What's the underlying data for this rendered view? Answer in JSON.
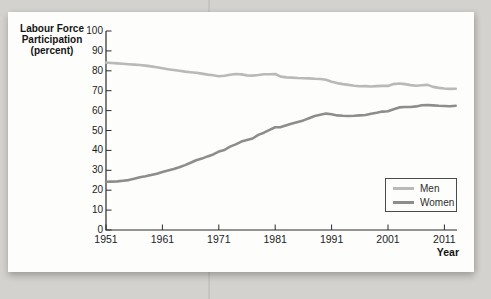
{
  "figure": {
    "y_axis_title_lines": [
      "Labour Force",
      "Participation",
      "(percent)"
    ],
    "x_axis_title": "Year"
  },
  "legend": {
    "items": [
      {
        "label": "Men",
        "color": "#b7bab5"
      },
      {
        "label": "Women",
        "color": "#8c8e8a"
      }
    ]
  },
  "colors": {
    "axis": "#2b2b2b",
    "men_line": "#b7bab5",
    "women_line": "#8c8e8a",
    "panel_bg": "#fdfdfc",
    "page_bg": "#d4d2cf"
  },
  "chart_data": {
    "type": "line",
    "title": "",
    "ylabel": "Labour Force Participation (percent)",
    "xlabel": "Year",
    "ylim": [
      0,
      100
    ],
    "xlim": [
      1951,
      2013
    ],
    "grid": false,
    "legend_position": "lower right",
    "y_ticks": [
      0,
      10,
      20,
      30,
      40,
      50,
      60,
      70,
      80,
      90,
      100
    ],
    "x_ticks": [
      1951,
      1961,
      1971,
      1981,
      1991,
      2001,
      2011
    ],
    "start_year": 1951,
    "series": [
      {
        "name": "Men",
        "color": "#b7bab5",
        "values": [
          84.1,
          83.9,
          83.7,
          83.5,
          83.3,
          83.1,
          82.9,
          82.6,
          82.2,
          81.8,
          81.3,
          80.8,
          80.4,
          80.0,
          79.6,
          79.3,
          79.0,
          78.6,
          78.1,
          77.8,
          77.3,
          77.5,
          78.0,
          78.4,
          78.2,
          77.7,
          77.6,
          77.9,
          78.3,
          78.3,
          78.4,
          77.1,
          76.7,
          76.6,
          76.4,
          76.3,
          76.2,
          76.0,
          75.9,
          75.5,
          74.5,
          73.8,
          73.3,
          72.9,
          72.5,
          72.2,
          72.3,
          72.1,
          72.3,
          72.4,
          72.4,
          73.3,
          73.6,
          73.3,
          72.8,
          72.5,
          72.7,
          72.9,
          71.9,
          71.4,
          71.1,
          70.9,
          71.0
        ]
      },
      {
        "name": "Women",
        "color": "#8c8e8a",
        "values": [
          24.2,
          24.3,
          24.4,
          24.7,
          25.1,
          25.8,
          26.5,
          27.0,
          27.6,
          28.3,
          29.1,
          29.9,
          30.6,
          31.5,
          32.6,
          33.8,
          35.0,
          35.9,
          37.0,
          38.0,
          39.4,
          40.2,
          41.9,
          43.0,
          44.4,
          45.2,
          46.0,
          47.8,
          48.9,
          50.3,
          51.6,
          51.7,
          52.6,
          53.5,
          54.3,
          55.1,
          56.2,
          57.3,
          57.9,
          58.5,
          58.2,
          57.6,
          57.4,
          57.3,
          57.4,
          57.6,
          57.8,
          58.4,
          58.9,
          59.5,
          59.7,
          60.7,
          61.6,
          61.8,
          61.8,
          62.1,
          62.7,
          62.8,
          62.6,
          62.4,
          62.3,
          62.2,
          62.4
        ]
      }
    ]
  }
}
